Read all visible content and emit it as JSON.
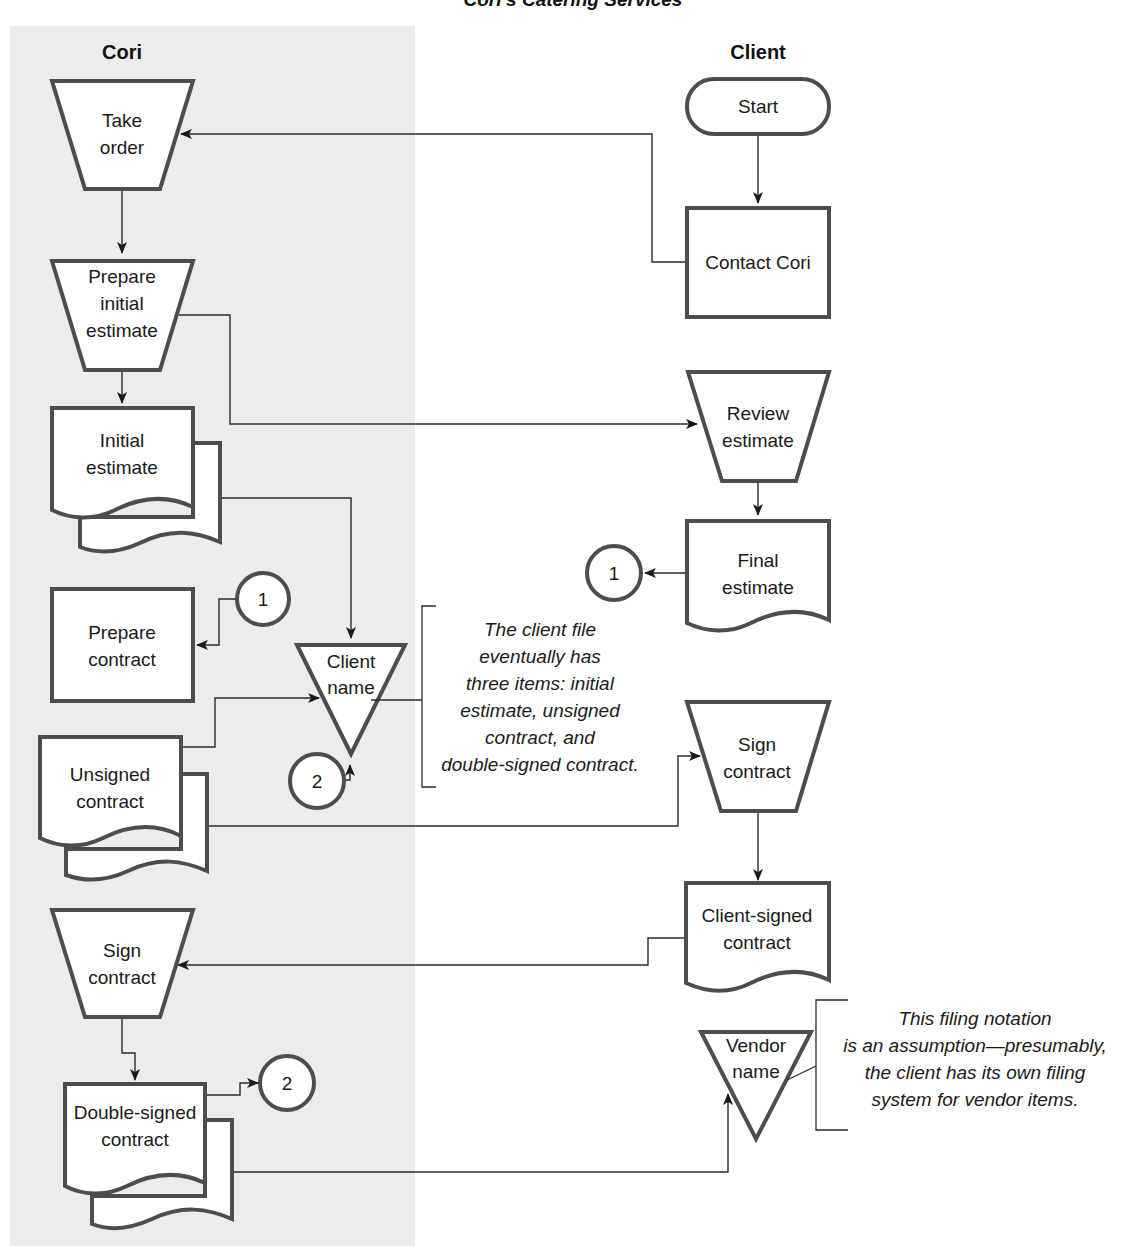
{
  "title": "Cori's Catering Services",
  "colors": {
    "lane_fill": "#ececec",
    "shape_stroke": "#4d4d4d",
    "line": "#2a2a2a",
    "background": "#ffffff"
  },
  "lanes": {
    "cori": {
      "header": "Cori"
    },
    "client": {
      "header": "Client"
    }
  },
  "cori_nodes": {
    "take_order": {
      "type": "manual-operation",
      "line1": "Take",
      "line2": "order"
    },
    "prepare_initial_estimate": {
      "type": "manual-operation",
      "line1": "Prepare",
      "line2": "initial",
      "line3": "estimate"
    },
    "initial_estimate": {
      "type": "multi-document",
      "line1": "Initial",
      "line2": "estimate"
    },
    "prepare_contract": {
      "type": "process",
      "line1": "Prepare",
      "line2": "contract"
    },
    "client_name_file": {
      "type": "offline-file",
      "line1": "Client",
      "line2": "name"
    },
    "unsigned_contract": {
      "type": "multi-document",
      "line1": "Unsigned",
      "line2": "contract"
    },
    "sign_contract": {
      "type": "manual-operation",
      "line1": "Sign",
      "line2": "contract"
    },
    "double_signed_contract": {
      "type": "multi-document",
      "line1": "Double-signed",
      "line2": "contract"
    }
  },
  "client_nodes": {
    "start": {
      "type": "terminator",
      "label": "Start"
    },
    "contact_cori": {
      "type": "process",
      "label": "Contact Cori"
    },
    "review_estimate": {
      "type": "manual-operation",
      "line1": "Review",
      "line2": "estimate"
    },
    "final_estimate": {
      "type": "document",
      "line1": "Final",
      "line2": "estimate"
    },
    "sign_contract": {
      "type": "manual-operation",
      "line1": "Sign",
      "line2": "contract"
    },
    "client_signed_contract": {
      "type": "document",
      "line1": "Client-signed",
      "line2": "contract"
    },
    "vendor_name_file": {
      "type": "offline-file",
      "line1": "Vendor",
      "line2": "name"
    }
  },
  "connectors": {
    "c1_out": "1",
    "c1_in": "1",
    "c2_out": "2",
    "c2_in": "2"
  },
  "annotations": {
    "client_file_note": {
      "lines": [
        "The client file",
        "eventually has",
        "three items: initial",
        "estimate, unsigned",
        "contract, and",
        "double-signed contract."
      ]
    },
    "vendor_file_note": {
      "lines": [
        "This filing notation",
        "is an assumption—presumably,",
        "the client has its own filing",
        "system for vendor items."
      ]
    }
  },
  "flows": [
    "Start -> Contact Cori",
    "Contact Cori -> Take order",
    "Take order -> Prepare initial estimate",
    "Prepare initial estimate -> Initial estimate",
    "Prepare initial estimate -> Review estimate",
    "Initial estimate -> Client name",
    "Review estimate -> Final estimate",
    "Final estimate -> (1)",
    "(1) -> Prepare contract",
    "Unsigned contract -> Client name",
    "Unsigned contract -> Sign contract (Client)",
    "(2) -> Client name",
    "Sign contract (Client) -> Client-signed contract",
    "Client-signed contract -> Sign contract (Cori)",
    "Sign contract (Cori) -> Double-signed contract",
    "Double-signed contract -> (2)",
    "Double-signed contract -> Vendor name"
  ]
}
